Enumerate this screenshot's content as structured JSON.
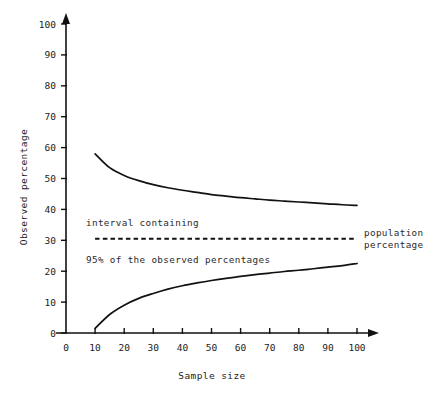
{
  "chart_data": {
    "type": "line",
    "title": "",
    "xlabel": "Sample size",
    "ylabel": "Observed percentage",
    "xlim": [
      0,
      110
    ],
    "ylim": [
      0,
      103
    ],
    "grid": false,
    "legend_position": "inline-annotations",
    "xticks": [
      0,
      10,
      20,
      30,
      40,
      50,
      60,
      70,
      80,
      90,
      100
    ],
    "xticklabels": [
      "0",
      "10",
      "20",
      "30",
      "40",
      "50",
      "60",
      "70",
      "80",
      "90",
      "100"
    ],
    "yticks": [
      0,
      10,
      20,
      30,
      40,
      50,
      60,
      70,
      80,
      90,
      100
    ],
    "yticklabels": [
      "0",
      "10",
      "20",
      "30",
      "40",
      "50",
      "60",
      "70",
      "80",
      "90",
      "100"
    ],
    "x": [
      10,
      15,
      20,
      25,
      30,
      35,
      40,
      45,
      50,
      55,
      60,
      65,
      70,
      75,
      80,
      85,
      90,
      95,
      100
    ],
    "series": [
      {
        "name": "upper 95% limit",
        "style": "solid",
        "values": [
          58.0,
          53.5,
          51.0,
          49.3,
          48.0,
          47.0,
          46.2,
          45.5,
          44.8,
          44.3,
          43.8,
          43.4,
          43.0,
          42.7,
          42.4,
          42.1,
          41.8,
          41.5,
          41.3
        ]
      },
      {
        "name": "population percentage",
        "style": "dashed",
        "values": [
          30.5,
          30.5,
          30.5,
          30.5,
          30.5,
          30.5,
          30.5,
          30.5,
          30.5,
          30.5,
          30.5,
          30.5,
          30.5,
          30.5,
          30.5,
          30.5,
          30.5,
          30.5,
          30.5
        ]
      },
      {
        "name": "lower 95% limit",
        "style": "solid",
        "values": [
          1.5,
          6.0,
          9.0,
          11.2,
          12.8,
          14.2,
          15.3,
          16.2,
          17.0,
          17.7,
          18.3,
          18.9,
          19.4,
          19.9,
          20.3,
          20.8,
          21.3,
          21.8,
          22.5
        ]
      }
    ],
    "annotations": [
      {
        "text": "interval containing",
        "x": 16,
        "y": 36
      },
      {
        "text": "95% of the observed percentages",
        "x": 16,
        "y": 25
      },
      {
        "text": "population percentage",
        "x": 103,
        "y": 30.5
      }
    ]
  },
  "labels": {
    "y_axis_title": "Observed percentage",
    "x_axis_title": "Sample size",
    "annotation_interval": "interval containing",
    "annotation_percentages": "95% of the observed percentages",
    "annotation_population_line1": "population",
    "annotation_population_line2": "percentage"
  },
  "colors": {
    "background": "#ffffff",
    "axis": "#111111",
    "curve": "#111111",
    "text": "#1c1c1c"
  }
}
